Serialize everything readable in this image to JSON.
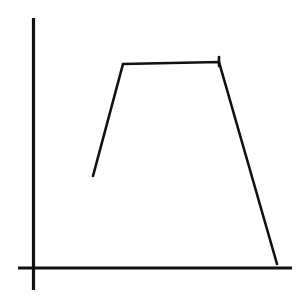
{
  "figure": {
    "title": "",
    "background_color": "#ffffff",
    "width": 306,
    "height": 301
  },
  "axes": {
    "x_axis": {
      "name": "x-axis",
      "label": "",
      "tick_labels": [],
      "color": "#111111",
      "stroke_width": 3.2,
      "x1": 18,
      "y1": 268,
      "x2": 292,
      "y2": 268
    },
    "y_axis": {
      "name": "y-axis",
      "label": "",
      "tick_labels": [],
      "color": "#111111",
      "stroke_width": 3.2,
      "x1": 33.5,
      "y1": 18,
      "x2": 33.5,
      "y2": 290
    }
  },
  "chart_data": {
    "type": "line",
    "title": "",
    "subtitle": "",
    "xlabel": "",
    "ylabel": "",
    "grid": false,
    "legend": null,
    "axis_ticks_shown": false,
    "axis_tick_labels_shown": false,
    "style": "hand-drawn schematic",
    "xlim": [
      33,
      292
    ],
    "ylim": [
      268,
      18
    ],
    "series": [
      {
        "name": "curve",
        "color": "#111111",
        "stroke_width": 2.6,
        "points_px": [
          {
            "x": 93,
            "y": 176
          },
          {
            "x": 123,
            "y": 64
          },
          {
            "x": 219,
            "y": 62
          },
          {
            "x": 277,
            "y": 264
          }
        ],
        "points_axis": [
          {
            "x": 0.232,
            "y": 0.368
          },
          {
            "x": 0.347,
            "y": 0.816
          },
          {
            "x": 0.718,
            "y": 0.824
          },
          {
            "x": 0.942,
            "y": 0.016
          }
        ],
        "segments": [
          {
            "name": "rise",
            "from": 0,
            "to": 1
          },
          {
            "name": "plateau",
            "from": 1,
            "to": 2
          },
          {
            "name": "fall",
            "from": 2,
            "to": 3
          }
        ]
      }
    ],
    "annotations": [
      {
        "name": "plateau-right-tick",
        "type": "tick",
        "x": 219,
        "y_top": 57,
        "y_bottom": 66,
        "color": "#111111",
        "stroke_width": 2.6
      }
    ]
  }
}
